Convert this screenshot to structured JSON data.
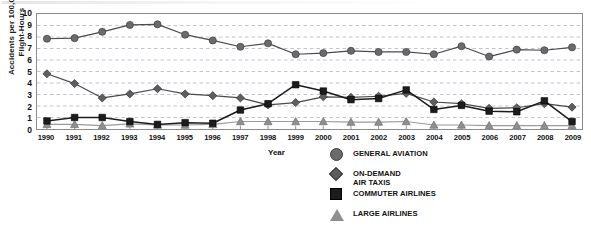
{
  "chart_data": {
    "type": "line",
    "title": "",
    "xlabel": "Year",
    "ylabel": "Accidents per 100,000\nFlight-Hours",
    "categories": [
      "1990",
      "1991",
      "1992",
      "1993",
      "1994",
      "1995",
      "1996",
      "1997",
      "1998",
      "1999",
      "2000",
      "2001",
      "2002",
      "2003",
      "2004",
      "2005",
      "2006",
      "2007",
      "2008",
      "2009"
    ],
    "ylim": [
      0,
      10
    ],
    "yticks": [
      "0",
      "1",
      "2",
      "3",
      "4",
      "5",
      "6",
      "7",
      "8",
      "9",
      "10"
    ],
    "grid": "horizontal-dashed",
    "legend_position": "bottom-right",
    "series": [
      {
        "name": "GENERAL AVIATION",
        "marker": "circle",
        "color": "#6b6b6b",
        "line_color": "#4a4a4a",
        "values": [
          7.85,
          7.9,
          8.45,
          9.05,
          9.1,
          8.2,
          7.7,
          7.15,
          7.45,
          6.5,
          6.6,
          6.8,
          6.7,
          6.7,
          6.5,
          7.2,
          6.3,
          6.9,
          6.85,
          7.1
        ]
      },
      {
        "name": "ON-DEMAND\nAIR TAXIS",
        "marker": "diamond",
        "color": "#5e5e5e",
        "line_color": "#4a4a4a",
        "values": [
          4.8,
          3.95,
          2.7,
          3.05,
          3.5,
          3.05,
          2.9,
          2.7,
          2.1,
          2.3,
          2.8,
          2.75,
          2.85,
          3.1,
          2.35,
          2.2,
          1.8,
          1.85,
          2.2,
          1.9
        ]
      },
      {
        "name": "COMMUTER AIRLINES",
        "marker": "square",
        "color": "#1c1c1c",
        "line_color": "#1c1c1c",
        "values": [
          0.7,
          1.0,
          1.0,
          0.65,
          0.4,
          0.55,
          0.5,
          1.65,
          2.2,
          3.85,
          3.3,
          2.55,
          2.65,
          3.4,
          1.7,
          2.05,
          1.55,
          1.5,
          2.45,
          0.65
        ]
      },
      {
        "name": "LARGE AIRLINES",
        "marker": "triangle",
        "color": "#8f8f8f",
        "line_color": "#9a9a9a",
        "values": [
          0.4,
          0.4,
          0.3,
          0.45,
          0.35,
          0.35,
          0.4,
          0.65,
          0.65,
          0.65,
          0.65,
          0.6,
          0.6,
          0.65,
          0.35,
          0.35,
          0.3,
          0.3,
          0.3,
          0.3
        ]
      }
    ]
  }
}
